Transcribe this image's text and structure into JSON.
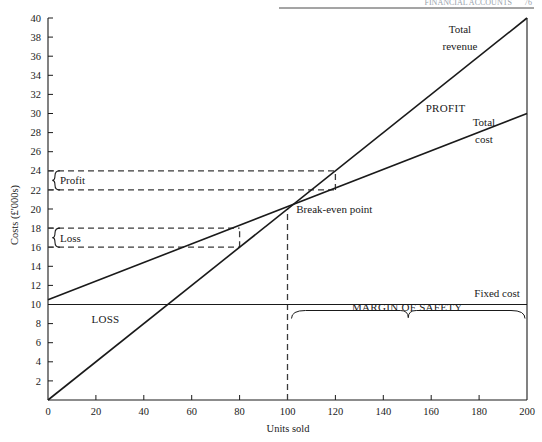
{
  "page": {
    "header_running_title": "FINANCIAL ACCOUNTS",
    "header_page_number": "76"
  },
  "chart_data": {
    "type": "line",
    "title": "",
    "xlabel": "Units sold",
    "ylabel": "Costs (£'000s)",
    "xlim": [
      0,
      200
    ],
    "ylim": [
      0,
      40
    ],
    "xticks": [
      "0",
      "20",
      "40",
      "60",
      "80",
      "100",
      "120",
      "140",
      "160",
      "180",
      "200"
    ],
    "xtick_values": [
      0,
      20,
      40,
      60,
      80,
      100,
      120,
      140,
      160,
      180,
      200
    ],
    "yticks": [
      "2",
      "4",
      "6",
      "8",
      "10",
      "12",
      "14",
      "16",
      "18",
      "20",
      "22",
      "24",
      "26",
      "28",
      "30",
      "32",
      "34",
      "36",
      "38",
      "40"
    ],
    "ytick_values": [
      2,
      4,
      6,
      8,
      10,
      12,
      14,
      16,
      18,
      20,
      22,
      24,
      26,
      28,
      30,
      32,
      34,
      36,
      38,
      40
    ],
    "grid": false,
    "legend": "none (inline labels)",
    "series": [
      {
        "name": "Total revenue",
        "label": "Total revenue",
        "x": [
          0,
          200
        ],
        "values": [
          0,
          40
        ],
        "style": "solid"
      },
      {
        "name": "Total cost",
        "label": "Total cost",
        "x": [
          0,
          200
        ],
        "values": [
          10.5,
          30
        ],
        "style": "solid"
      },
      {
        "name": "Fixed cost",
        "label": "Fixed cost",
        "x": [
          0,
          200
        ],
        "values": [
          10,
          10
        ],
        "style": "solid"
      }
    ],
    "annotations": [
      {
        "name": "break-even-point",
        "text": "Break-even point",
        "x": 100,
        "y": 20
      },
      {
        "name": "profit-region",
        "text": "PROFIT",
        "x": 160,
        "y": 30
      },
      {
        "name": "loss-region",
        "text": "LOSS",
        "x": 25,
        "y": 8
      },
      {
        "name": "margin-of-safety",
        "text": "MARGIN OF SAFETY",
        "x_from": 100,
        "x_to": 200,
        "y": 9
      },
      {
        "name": "profit-bracket",
        "text": "Profit",
        "y_from": 22,
        "y_to": 24,
        "at_x": 120
      },
      {
        "name": "loss-bracket",
        "text": "Loss",
        "y_from": 16,
        "y_to": 18,
        "at_x": 80
      }
    ],
    "guides": [
      {
        "name": "break-even-vertical",
        "x": 100,
        "y_from": 0,
        "y_to": 20,
        "style": "dashed"
      },
      {
        "name": "profit-upper-guide",
        "y": 24,
        "x_from": 0,
        "x_to": 120,
        "style": "dashed"
      },
      {
        "name": "profit-lower-guide",
        "y": 22,
        "x_from": 0,
        "x_to": 120,
        "style": "dashed"
      },
      {
        "name": "profit-vertical-tick",
        "x": 120,
        "y_from": 22,
        "y_to": 24,
        "style": "dashed"
      },
      {
        "name": "loss-upper-guide",
        "y": 18,
        "x_from": 0,
        "x_to": 80,
        "style": "dashed"
      },
      {
        "name": "loss-lower-guide",
        "y": 16,
        "x_from": 0,
        "x_to": 80,
        "style": "dashed"
      },
      {
        "name": "loss-vertical-tick",
        "x": 80,
        "y_from": 16,
        "y_to": 18,
        "style": "dashed"
      }
    ],
    "colors": {
      "line": "#1a1a1a",
      "dashed": "#3a3a3a",
      "axis": "#1a1a1a",
      "background": "#ffffff",
      "header": "#9aa3ad"
    }
  }
}
